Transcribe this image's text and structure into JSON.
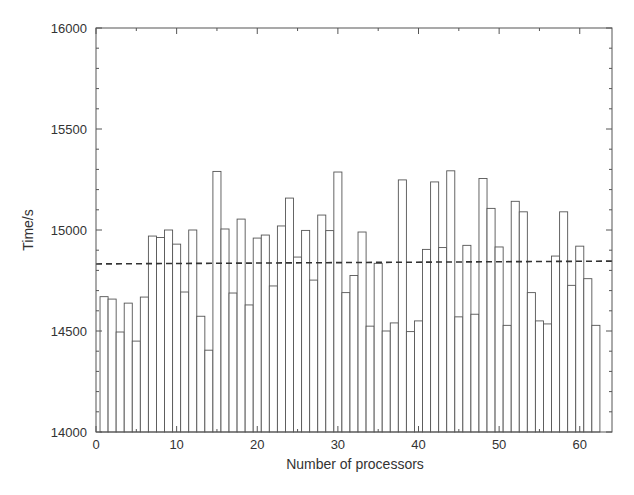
{
  "chart_data": {
    "type": "bar",
    "title": "",
    "xlabel": "Number of processors",
    "ylabel": "Time/s",
    "xlim": [
      0,
      64
    ],
    "ylim": [
      14000,
      16000
    ],
    "xticks": [
      0,
      10,
      20,
      30,
      40,
      50,
      60
    ],
    "yticks": [
      14000,
      14500,
      15000,
      15500,
      16000
    ],
    "y_minor_step": 100,
    "x_minor_step": 5,
    "grid": false,
    "legend": null,
    "bar_fill": "#ffffff",
    "bar_edge": "#555555",
    "x": [
      1,
      2,
      3,
      4,
      5,
      6,
      7,
      8,
      9,
      10,
      11,
      12,
      13,
      14,
      15,
      16,
      17,
      18,
      19,
      20,
      21,
      22,
      23,
      24,
      25,
      26,
      27,
      28,
      29,
      30,
      31,
      32,
      33,
      34,
      35,
      36,
      37,
      38,
      39,
      40,
      41,
      42,
      43,
      44,
      45,
      46,
      47,
      48,
      49,
      50,
      51,
      52,
      53,
      54,
      55,
      56,
      57,
      58,
      59,
      60,
      61,
      62
    ],
    "values": [
      14670,
      14658,
      14495,
      14638,
      14450,
      14668,
      14970,
      14963,
      15000,
      14930,
      14693,
      15000,
      14573,
      14405,
      15290,
      15005,
      14688,
      15054,
      14629,
      14960,
      14975,
      14723,
      15020,
      15158,
      14866,
      14998,
      14752,
      15074,
      14997,
      15287,
      14690,
      14775,
      14990,
      14524,
      14835,
      14500,
      14540,
      15248,
      14497,
      14550,
      14904,
      15238,
      14913,
      15293,
      14570,
      14924,
      14583,
      15255,
      15107,
      14916,
      14528,
      15142,
      15090,
      14690,
      14550,
      14535,
      14871,
      15090,
      14726,
      14920,
      14759,
      14528
    ],
    "mean_line": {
      "style": "dashed",
      "color": "#333333",
      "y_start": 14832,
      "y_end": 14846
    }
  }
}
